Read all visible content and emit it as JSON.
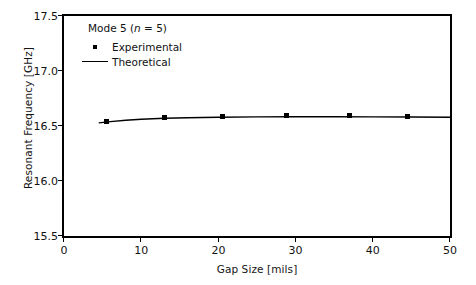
{
  "chart_data": {
    "type": "scatter",
    "title": "",
    "xlabel": "Gap Size [mils]",
    "ylabel": "Resonant Frequency [GHz]",
    "xlim": [
      0,
      50
    ],
    "ylim": [
      15.5,
      17.5
    ],
    "xticks": [
      0,
      10,
      20,
      30,
      40,
      50
    ],
    "xtick_labels": [
      "0",
      "10",
      "20",
      "30",
      "40",
      "50"
    ],
    "yticks": [
      15.5,
      16.0,
      16.5,
      17.0,
      17.5
    ],
    "ytick_labels": [
      "15.5",
      "16.0",
      "16.5",
      "17.0",
      "17.5"
    ],
    "grid": false,
    "legend_position": "upper-left-inside",
    "annotation": "Mode 5 (n = 5)",
    "annotation_mode": "Mode 5 (",
    "annotation_var": "n",
    "annotation_tail": " = 5)",
    "series": [
      {
        "name": "Experimental",
        "style": "square-markers",
        "x": [
          5.5,
          13.0,
          20.5,
          28.8,
          37.0,
          44.5
        ],
        "y": [
          16.545,
          16.575,
          16.585,
          16.592,
          16.594,
          16.59
        ]
      },
      {
        "name": "Theoretical",
        "style": "line",
        "x": [
          4.5,
          6.0,
          8.0,
          10.0,
          13.0,
          16.0,
          20.0,
          25.0,
          30.0,
          35.0,
          40.0,
          45.0,
          50.0
        ],
        "y": [
          16.528,
          16.54,
          16.552,
          16.561,
          16.57,
          16.575,
          16.58,
          16.583,
          16.584,
          16.584,
          16.583,
          16.582,
          16.58
        ]
      }
    ]
  },
  "legend": {
    "experimental_label": "Experimental",
    "theoretical_label": "Theoretical"
  },
  "colors": {
    "axis": "#000000",
    "data": "#000000",
    "background": "#ffffff"
  }
}
